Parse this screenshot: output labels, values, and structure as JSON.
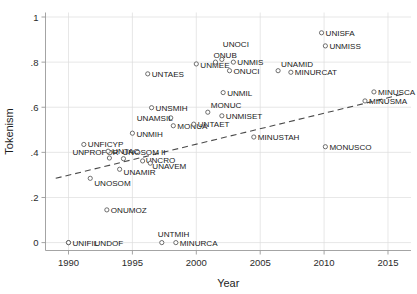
{
  "chart_data": {
    "type": "scatter",
    "title": "",
    "xlabel": "Year",
    "ylabel": "Tokenism",
    "xlim": [
      1988.2,
      2016.8
    ],
    "ylim": [
      -0.035,
      1.02
    ],
    "xticks": [
      1990,
      1995,
      2000,
      2005,
      2010,
      2015
    ],
    "xtick_labels": [
      "1990",
      "1995",
      "2000",
      "2005",
      "2010",
      "2015"
    ],
    "yticks": [
      0,
      0.2,
      0.4,
      0.6,
      0.8,
      1
    ],
    "ytick_labels": [
      "0",
      ".2",
      ".4",
      ".6",
      ".8",
      "1"
    ],
    "grid": true,
    "legend": "none",
    "marker_style": "open-circle",
    "colors": {
      "marker_edge": "#555555",
      "marker_fill": "#ffffff",
      "fitline": "#4a4a4a",
      "grid": "#dcdcdc",
      "axis": "#9a9a9a",
      "text": "#1a1a1a"
    },
    "annotations": [
      {
        "type": "trendline",
        "style": "dashed",
        "x": [
          1989.0,
          2016.3
        ],
        "y": [
          0.285,
          0.66
        ]
      }
    ],
    "points": [
      {
        "label": "UNIFIL",
        "x": 1990.0,
        "y": 0.0,
        "label_dx": 4,
        "label_dy": 3
      },
      {
        "label": "UNDOF",
        "x": 1990.0,
        "y": 0.0,
        "label_dx": 26,
        "label_dy": 3
      },
      {
        "label": "ONUMOZ",
        "x": 1993.0,
        "y": 0.145,
        "label_dx": 4,
        "label_dy": 3
      },
      {
        "label": "UNTMIH",
        "x": 1997.3,
        "y": 0.0,
        "label_dx": -4,
        "label_dy": -6
      },
      {
        "label": "MINURCA",
        "x": 1998.4,
        "y": 0.0,
        "label_dx": 4,
        "label_dy": 3
      },
      {
        "label": "UNOSOM",
        "x": 1991.7,
        "y": 0.285,
        "label_dx": 4,
        "label_dy": 8
      },
      {
        "label": "UNAMIR",
        "x": 1994.0,
        "y": 0.325,
        "label_dx": 4,
        "label_dy": 6
      },
      {
        "label": "UNPROFOR",
        "x": 1993.2,
        "y": 0.375,
        "label_dx": -37,
        "label_dy": -3
      },
      {
        "label": "UNOSOM II",
        "x": 1994.3,
        "y": 0.372,
        "label_dx": -1,
        "label_dy": -4
      },
      {
        "label": "UNCRO",
        "x": 1995.8,
        "y": 0.362,
        "label_dx": 3,
        "label_dy": 2
      },
      {
        "label": "UNAVEM",
        "x": 1996.4,
        "y": 0.352,
        "label_dx": 2,
        "label_dy": 6
      },
      {
        "label": "UNTAC",
        "x": 1993.1,
        "y": 0.405,
        "label_dx": 4,
        "label_dy": 3
      },
      {
        "label": "UNFICYP",
        "x": 1991.2,
        "y": 0.435,
        "label_dx": 4,
        "label_dy": 3
      },
      {
        "label": "UNMIH",
        "x": 1995.0,
        "y": 0.485,
        "label_dx": 4,
        "label_dy": 4
      },
      {
        "label": "MONUA",
        "x": 1998.2,
        "y": 0.518,
        "label_dx": 4,
        "label_dy": 3
      },
      {
        "label": "UNTAET",
        "x": 1999.8,
        "y": 0.525,
        "label_dx": 4,
        "label_dy": 3
      },
      {
        "label": "UNAMSIL",
        "x": 1998.0,
        "y": 0.553,
        "label_dx": -34,
        "label_dy": 3
      },
      {
        "label": "UNSMIH",
        "x": 1996.5,
        "y": 0.598,
        "label_dx": 4,
        "label_dy": 3
      },
      {
        "label": "MONUC",
        "x": 2000.9,
        "y": 0.578,
        "label_dx": 3,
        "label_dy": -4
      },
      {
        "label": "UNMISET",
        "x": 2002.0,
        "y": 0.562,
        "label_dx": 4,
        "label_dy": 3
      },
      {
        "label": "MINUSTAH",
        "x": 2004.5,
        "y": 0.468,
        "label_dx": 4,
        "label_dy": 3
      },
      {
        "label": "MONUSCO",
        "x": 2010.1,
        "y": 0.425,
        "label_dx": 4,
        "label_dy": 3
      },
      {
        "label": "UNMIL",
        "x": 2002.1,
        "y": 0.665,
        "label_dx": 4,
        "label_dy": 3
      },
      {
        "label": "UNMEE",
        "x": 2000.0,
        "y": 0.792,
        "label_dx": 4,
        "label_dy": 4
      },
      {
        "label": "ONUB",
        "x": 2001.5,
        "y": 0.8,
        "label_dx": -2,
        "label_dy": -4
      },
      {
        "label": "UNOCI",
        "x": 2002.0,
        "y": 0.812,
        "label_dx": 1,
        "label_dy": -12
      },
      {
        "label": "UNMIS",
        "x": 2002.9,
        "y": 0.8,
        "label_dx": 4,
        "label_dy": 3
      },
      {
        "label": "ONUCI",
        "x": 2002.6,
        "y": 0.762,
        "label_dx": 4,
        "label_dy": 3
      },
      {
        "label": "UNAMID",
        "x": 2006.4,
        "y": 0.762,
        "label_dx": 3,
        "label_dy": -4
      },
      {
        "label": "MINURCAT",
        "x": 2007.4,
        "y": 0.755,
        "label_dx": 4,
        "label_dy": 3
      },
      {
        "label": "UNTAES",
        "x": 1996.2,
        "y": 0.748,
        "label_dx": 4,
        "label_dy": 3
      },
      {
        "label": "UNISFA",
        "x": 2009.8,
        "y": 0.93,
        "label_dx": 4,
        "label_dy": 3
      },
      {
        "label": "UNMISS",
        "x": 2010.1,
        "y": 0.872,
        "label_dx": 4,
        "label_dy": 3
      },
      {
        "label": "MINUSCA",
        "x": 2013.9,
        "y": 0.668,
        "label_dx": 4,
        "label_dy": 3
      },
      {
        "label": "MINUSMA",
        "x": 2013.2,
        "y": 0.628,
        "label_dx": 4,
        "label_dy": 3
      }
    ]
  }
}
